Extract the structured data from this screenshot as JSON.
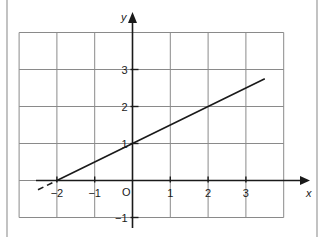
{
  "chart_data": {
    "type": "line",
    "title": "",
    "xlabel": "x",
    "ylabel": "y",
    "origin_label": "O",
    "xlim": [
      -3,
      4
    ],
    "ylim": [
      -1,
      4
    ],
    "x_ticks": [
      -2,
      -1,
      1,
      2,
      3
    ],
    "y_ticks": [
      -1,
      1,
      2,
      3
    ],
    "x_tick_labels": [
      "−2",
      "−1",
      "1",
      "2",
      "3"
    ],
    "y_tick_labels": [
      "−1",
      "1",
      "2",
      "3"
    ],
    "grid": true,
    "legend": null,
    "series": [
      {
        "name": "y = 0.5x + 1",
        "x": [
          -2,
          0,
          2,
          3.5
        ],
        "y": [
          0,
          1,
          2,
          2.75
        ],
        "style": "solid"
      },
      {
        "name": "extension",
        "x": [
          -2.5,
          -2
        ],
        "y": [
          -0.25,
          0
        ],
        "style": "dashed"
      }
    ],
    "colors": {
      "line": "#1a1a1a",
      "grid": "#8a8a8a",
      "axis": "#1a1a1a",
      "frame": "#9a9a9a"
    }
  }
}
